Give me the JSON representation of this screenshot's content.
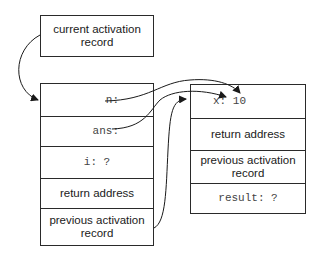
{
  "current_pointer": {
    "label_line1": "current activation",
    "label_line2": "record"
  },
  "caller_frame": {
    "rows": [
      {
        "label": "n:"
      },
      {
        "label": "ans:"
      },
      {
        "label": "i: ?"
      },
      {
        "label": "return address"
      },
      {
        "label_line1": "previous activation",
        "label_line2": "record"
      }
    ]
  },
  "callee_frame": {
    "rows": [
      {
        "label": "x: 10"
      },
      {
        "label": "return address"
      },
      {
        "label_line1": "previous activation",
        "label_line2": "record"
      },
      {
        "label": "result: ?"
      }
    ]
  },
  "arrows": [
    {
      "from": "current activation record",
      "to": "caller frame"
    },
    {
      "from": "n:",
      "to": "x: 10"
    },
    {
      "from": "ans:",
      "to": "x: 10"
    },
    {
      "from": "caller previous activation record",
      "to": "callee frame top"
    }
  ],
  "colors": {
    "stroke": "#2a2a2a",
    "text": "#1a1a1a",
    "code_text": "#444444",
    "background": "#ffffff"
  }
}
